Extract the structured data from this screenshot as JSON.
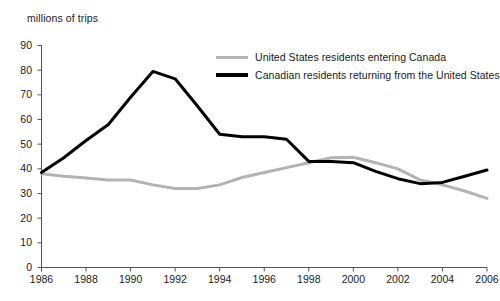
{
  "chart_data": {
    "type": "line",
    "title": "",
    "ylabel": "millions of trips",
    "xlabel": "",
    "ylim": [
      0,
      90
    ],
    "xlim": [
      1986,
      2006
    ],
    "grid": false,
    "legend_position": "top-right",
    "yticks": [
      90,
      80,
      70,
      60,
      50,
      40,
      30,
      20,
      10,
      0
    ],
    "xticks": [
      1986,
      1988,
      1990,
      1992,
      1994,
      1996,
      1998,
      2000,
      2002,
      2004,
      2006
    ],
    "x": [
      1986,
      1987,
      1988,
      1989,
      1990,
      1991,
      1992,
      1993,
      1994,
      1995,
      1996,
      1997,
      1998,
      1999,
      2000,
      2001,
      2002,
      2003,
      2004,
      2005,
      2006
    ],
    "series": [
      {
        "name": "United States residents entering Canada",
        "color": "#b3b3b3",
        "values": [
          38.0,
          37.0,
          36.3,
          35.5,
          35.5,
          33.5,
          32.0,
          32.0,
          33.5,
          36.5,
          38.5,
          40.5,
          42.5,
          44.5,
          44.7,
          42.5,
          40.0,
          35.5,
          33.5,
          31.0,
          28.0
        ]
      },
      {
        "name": "Canadian residents returning from the United States",
        "color": "#000000",
        "values": [
          38.5,
          44.5,
          51.5,
          58.0,
          69.0,
          79.5,
          76.5,
          65.5,
          54.0,
          53.0,
          53.0,
          52.0,
          43.0,
          43.0,
          42.5,
          39.0,
          36.0,
          34.0,
          34.5,
          37.0,
          39.5
        ]
      }
    ]
  },
  "legend": {
    "items": [
      {
        "label": "United States residents entering Canada"
      },
      {
        "label": "Canadian residents returning from the United States"
      }
    ]
  },
  "axis": {
    "y_title": "millions of trips"
  }
}
